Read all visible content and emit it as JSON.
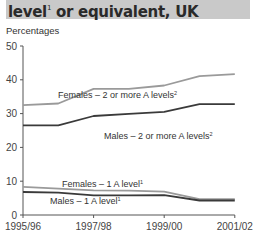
{
  "header": {
    "title": "level",
    "title_sup": "1",
    "title_rest": " or equivalent, UK"
  },
  "chart_data": {
    "type": "line",
    "title": "level1 or equivalent, UK",
    "ylabel": "Percentages",
    "xlabel": "",
    "x": [
      "1995/96",
      "1996/97",
      "1997/98",
      "1998/99",
      "1999/00",
      "2000/01",
      "2001/02"
    ],
    "x_tick_labels": [
      "1995/96",
      "1997/98",
      "1999/00",
      "2001/02"
    ],
    "y_ticks": [
      0,
      10,
      20,
      30,
      40,
      50
    ],
    "ylim": [
      0,
      50
    ],
    "grid": false,
    "legend_position": "inline labels",
    "series": [
      {
        "name": "Females – 2 or more A levels",
        "sup": "2",
        "color": "#9a9a9a",
        "values": [
          32.5,
          33.0,
          37.3,
          37.3,
          38.3,
          41.1,
          41.7
        ],
        "label_pos": [
          58,
          98
        ]
      },
      {
        "name": "Males – 2 or more A levels",
        "sup": "2",
        "color": "#3a3a3a",
        "values": [
          26.5,
          26.5,
          29.3,
          29.9,
          30.5,
          32.8,
          32.8
        ],
        "label_pos": [
          104,
          139
        ]
      },
      {
        "name": "Females – 1 A level",
        "sup": "1",
        "color": "#9a9a9a",
        "values": [
          8.3,
          7.8,
          7.3,
          7.2,
          6.9,
          4.7,
          4.7
        ],
        "label_pos": [
          62,
          187
        ]
      },
      {
        "name": "Males – 1 A level",
        "sup": "1",
        "color": "#3a3a3a",
        "values": [
          6.8,
          6.6,
          5.8,
          5.8,
          5.9,
          4.3,
          4.3
        ],
        "label_pos": [
          50,
          204
        ]
      }
    ]
  }
}
